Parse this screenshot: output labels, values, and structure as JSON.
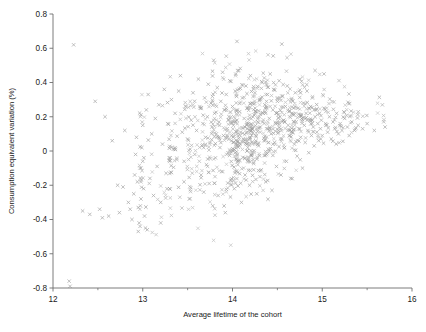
{
  "chart_data": {
    "type": "scatter",
    "title": "",
    "xlabel": "Average lifetime of the cohort",
    "ylabel": "Consumption equivalent variation (%)",
    "xlim": [
      12,
      16
    ],
    "ylim": [
      -0.8,
      0.8
    ],
    "grid": false,
    "legend": null,
    "marker": "x",
    "marker_color": "#9a9a9a",
    "x_ticks": [
      12,
      13,
      14,
      15,
      16
    ],
    "x_tick_labels": [
      "12",
      "13",
      "14",
      "15",
      "16"
    ],
    "x_minor_ticks": [
      12.5,
      13.5,
      14.5,
      15.5
    ],
    "y_ticks": [
      0.8,
      0.6,
      0.4,
      0.2,
      0,
      -0.2,
      -0.4,
      -0.6,
      -0.8
    ],
    "y_tick_labels": [
      "0.8",
      "0.6",
      "0.4",
      "0.2",
      "0",
      "-0.2",
      "-0.4",
      "-0.6",
      "-0.8"
    ],
    "points": [
      [
        12.18,
        -0.76
      ],
      [
        12.19,
        -0.79
      ],
      [
        12.23,
        0.62
      ],
      [
        12.33,
        -0.35
      ],
      [
        12.41,
        -0.37
      ],
      [
        12.47,
        0.29
      ],
      [
        12.52,
        -0.34
      ],
      [
        12.55,
        -0.39
      ],
      [
        12.58,
        0.2
      ],
      [
        12.62,
        -0.38
      ],
      [
        12.66,
        0.06
      ],
      [
        12.72,
        -0.2
      ],
      [
        12.74,
        -0.36
      ],
      [
        12.78,
        -0.21
      ],
      [
        12.8,
        0.12
      ],
      [
        12.84,
        -0.3
      ],
      [
        12.86,
        -0.34
      ],
      [
        12.88,
        -0.4
      ],
      [
        12.9,
        -0.25
      ],
      [
        12.91,
        -0.14
      ],
      [
        12.92,
        -0.02
      ],
      [
        12.93,
        0.08
      ],
      [
        12.94,
        -0.18
      ],
      [
        12.95,
        -0.33
      ],
      [
        12.96,
        -0.42
      ],
      [
        12.97,
        -0.44
      ],
      [
        12.98,
        -0.28
      ],
      [
        12.98,
        -0.1
      ],
      [
        12.99,
        0.02
      ],
      [
        13.0,
        0.15
      ],
      [
        13.0,
        -0.06
      ],
      [
        13.01,
        -0.22
      ],
      [
        13.02,
        -0.38
      ],
      [
        13.03,
        -0.45
      ],
      [
        13.04,
        0.24
      ],
      [
        13.06,
        0.33
      ],
      [
        13.08,
        -0.16
      ],
      [
        13.1,
        0.1
      ],
      [
        13.12,
        -0.26
      ],
      [
        13.14,
        0.19
      ],
      [
        13.16,
        -0.09
      ],
      [
        13.18,
        0.27
      ],
      [
        13.2,
        -0.3
      ],
      [
        13.22,
        0.04
      ],
      [
        13.24,
        0.36
      ],
      [
        13.26,
        -0.13
      ],
      [
        13.28,
        0.16
      ],
      [
        13.3,
        -0.22
      ],
      [
        13.32,
        0.3
      ],
      [
        13.34,
        0.01
      ],
      [
        13.36,
        0.22
      ],
      [
        13.38,
        -0.05
      ],
      [
        13.4,
        0.35
      ],
      [
        13.42,
        0.44
      ],
      [
        13.44,
        0.11
      ],
      [
        13.46,
        -0.18
      ],
      [
        13.48,
        0.26
      ],
      [
        13.5,
        0.07
      ],
      [
        13.52,
        -0.28
      ],
      [
        13.54,
        0.18
      ],
      [
        13.56,
        0.34
      ],
      [
        13.58,
        -0.02
      ],
      [
        13.6,
        0.12
      ],
      [
        13.62,
        0.42
      ],
      [
        13.64,
        0.25
      ],
      [
        13.65,
        -0.14
      ],
      [
        13.66,
        0.03
      ],
      [
        13.67,
        0.16
      ],
      [
        13.68,
        -0.24
      ],
      [
        13.69,
        0.31
      ],
      [
        13.7,
        0.08
      ],
      [
        13.71,
        -0.08
      ],
      [
        13.72,
        0.2
      ],
      [
        13.73,
        0.39
      ],
      [
        13.74,
        -0.19
      ],
      [
        13.75,
        0.05
      ],
      [
        13.76,
        0.28
      ],
      [
        13.77,
        0.14
      ],
      [
        13.78,
        -0.32
      ],
      [
        13.79,
        0.53
      ],
      [
        13.8,
        0.22
      ],
      [
        13.81,
        -0.04
      ],
      [
        13.82,
        0.1
      ],
      [
        13.83,
        0.37
      ],
      [
        13.84,
        -0.26
      ],
      [
        13.85,
        0.17
      ],
      [
        13.86,
        0.02
      ],
      [
        13.87,
        0.29
      ],
      [
        13.88,
        -0.12
      ],
      [
        13.89,
        0.46
      ],
      [
        13.9,
        0.09
      ],
      [
        13.91,
        0.24
      ],
      [
        13.92,
        -0.36
      ],
      [
        13.93,
        0.33
      ],
      [
        13.94,
        0.13
      ],
      [
        13.95,
        -0.01
      ],
      [
        13.96,
        0.2
      ],
      [
        13.97,
        0.41
      ],
      [
        13.98,
        -0.17
      ],
      [
        13.99,
        0.06
      ],
      [
        14.0,
        0.26
      ],
      [
        14.01,
        0.15
      ],
      [
        14.02,
        -0.22
      ],
      [
        14.03,
        0.35
      ],
      [
        14.04,
        0.04
      ],
      [
        14.05,
        0.18
      ],
      [
        14.06,
        -0.08
      ],
      [
        14.07,
        0.47
      ],
      [
        14.08,
        0.23
      ],
      [
        14.09,
        0.11
      ],
      [
        14.1,
        -0.3
      ],
      [
        14.11,
        0.31
      ],
      [
        14.12,
        0.07
      ],
      [
        14.13,
        0.19
      ],
      [
        14.14,
        -0.14
      ],
      [
        14.15,
        0.38
      ],
      [
        14.16,
        0.25
      ],
      [
        14.17,
        0.02
      ],
      [
        14.18,
        0.16
      ],
      [
        14.19,
        -0.2
      ],
      [
        14.2,
        0.44
      ],
      [
        14.21,
        0.12
      ],
      [
        14.22,
        0.28
      ],
      [
        14.23,
        -0.05
      ],
      [
        14.24,
        0.21
      ],
      [
        14.25,
        0.34
      ],
      [
        14.26,
        0.09
      ],
      [
        14.27,
        -0.25
      ],
      [
        14.28,
        0.17
      ],
      [
        14.29,
        0.03
      ],
      [
        14.3,
        0.3
      ],
      [
        14.31,
        0.14
      ],
      [
        14.32,
        -0.11
      ],
      [
        14.33,
        0.4
      ],
      [
        14.34,
        0.22
      ],
      [
        14.35,
        0.06
      ],
      [
        14.36,
        0.27
      ],
      [
        14.37,
        -0.18
      ],
      [
        14.38,
        0.13
      ],
      [
        14.39,
        0.33
      ],
      [
        14.4,
        0.01
      ],
      [
        14.41,
        0.19
      ],
      [
        14.42,
        0.45
      ],
      [
        14.43,
        0.1
      ],
      [
        14.44,
        -0.23
      ],
      [
        14.45,
        0.24
      ],
      [
        14.46,
        0.36
      ],
      [
        14.47,
        0.05
      ],
      [
        14.48,
        0.16
      ],
      [
        14.49,
        -0.09
      ],
      [
        14.5,
        0.29
      ],
      [
        14.51,
        0.12
      ],
      [
        14.52,
        0.41
      ],
      [
        14.53,
        0.2
      ],
      [
        14.54,
        -0.14
      ],
      [
        14.55,
        0.07
      ],
      [
        14.56,
        0.32
      ],
      [
        14.57,
        0.18
      ],
      [
        14.58,
        0.02
      ],
      [
        14.59,
        0.26
      ],
      [
        14.6,
        -0.06
      ],
      [
        14.61,
        0.38
      ],
      [
        14.62,
        0.15
      ],
      [
        14.63,
        0.23
      ],
      [
        14.64,
        0.09
      ],
      [
        14.65,
        -0.16
      ],
      [
        14.66,
        0.3
      ],
      [
        14.67,
        0.11
      ],
      [
        14.68,
        0.21
      ],
      [
        14.69,
        0.04
      ],
      [
        14.7,
        0.34
      ],
      [
        14.71,
        0.17
      ],
      [
        14.72,
        -0.03
      ],
      [
        14.73,
        0.25
      ],
      [
        14.74,
        0.13
      ],
      [
        14.75,
        0.42
      ],
      [
        14.76,
        0.08
      ],
      [
        14.77,
        0.19
      ],
      [
        14.78,
        -0.1
      ],
      [
        14.79,
        0.28
      ],
      [
        14.8,
        0.15
      ],
      [
        14.81,
        0.05
      ],
      [
        14.82,
        0.22
      ],
      [
        14.83,
        0.35
      ],
      [
        14.84,
        0.12
      ],
      [
        14.85,
        -0.01
      ],
      [
        14.86,
        0.18
      ],
      [
        14.87,
        0.26
      ],
      [
        14.88,
        0.09
      ],
      [
        14.89,
        0.31
      ],
      [
        14.9,
        0.14
      ],
      [
        14.91,
        0.03
      ],
      [
        14.92,
        0.2
      ],
      [
        14.93,
        0.24
      ],
      [
        14.94,
        0.11
      ],
      [
        14.95,
        0.16
      ],
      [
        14.96,
        0.06
      ],
      [
        14.97,
        0.22
      ],
      [
        14.98,
        0.13
      ],
      [
        14.99,
        0.18
      ],
      [
        15.0,
        0.09
      ],
      [
        15.02,
        0.25
      ],
      [
        15.04,
        0.15
      ],
      [
        15.06,
        0.11
      ],
      [
        15.08,
        0.2
      ],
      [
        15.1,
        0.07
      ],
      [
        15.12,
        0.17
      ],
      [
        15.14,
        0.13
      ],
      [
        15.16,
        0.22
      ],
      [
        15.18,
        0.1
      ],
      [
        15.2,
        0.16
      ],
      [
        15.22,
        0.12
      ],
      [
        15.25,
        0.19
      ],
      [
        15.28,
        0.14
      ],
      [
        15.3,
        0.09
      ],
      [
        15.33,
        0.17
      ],
      [
        15.36,
        0.12
      ],
      [
        15.4,
        0.15
      ],
      [
        15.45,
        0.13
      ],
      [
        15.5,
        0.16
      ],
      [
        15.58,
        0.12
      ],
      [
        15.7,
        0.14
      ],
      [
        14.05,
        0.64
      ],
      [
        14.92,
        0.47
      ],
      [
        15.02,
        0.45
      ],
      [
        13.2,
        -0.42
      ],
      [
        13.05,
        -0.46
      ],
      [
        12.95,
        -0.47
      ]
    ],
    "point_count": 900
  },
  "axes": {
    "x_title": "Average lifetime of the cohort",
    "y_title": "Consumption equivalent variation (%)"
  }
}
